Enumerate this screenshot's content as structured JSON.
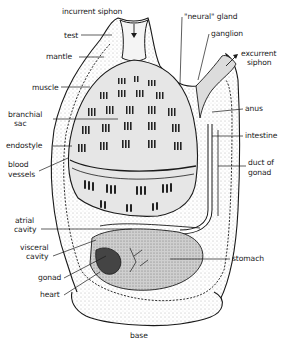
{
  "figure": {
    "colors": {
      "ink": "#1a1a1a",
      "paper": "#ffffff",
      "shade": "#d8d8d8"
    }
  },
  "labels": {
    "incurrent_siphon": "incurrent siphon",
    "test": "test",
    "mantle": "mantle",
    "muscle": "muscle",
    "branchial_sac_1": "branchial",
    "branchial_sac_2": "sac",
    "endostyle": "endostyle",
    "blood_vessels_1": "blood",
    "blood_vessels_2": "vessels",
    "atrial_cavity_1": "atrial",
    "atrial_cavity_2": "cavity",
    "visceral_cavity_1": "visceral",
    "visceral_cavity_2": "cavity",
    "gonad": "gonad",
    "heart": "heart",
    "base": "base",
    "neural_gland": "\"neural\" gland",
    "ganglion": "ganglion",
    "excurrent_siphon_1": "excurrent",
    "excurrent_siphon_2": "siphon",
    "anus": "anus",
    "intestine": "intestine",
    "duct_of_gonad_1": "duct of",
    "duct_of_gonad_2": "gonad",
    "stomach": "stomach"
  }
}
